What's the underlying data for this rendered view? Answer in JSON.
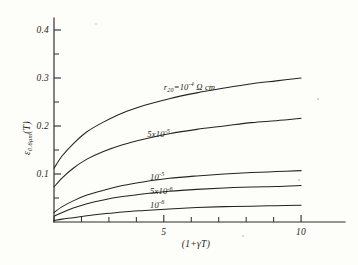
{
  "figure": {
    "background_color": "#fdfdfa",
    "ink_color": "#23231f",
    "y_axis_title_main": "ε",
    "y_axis_title_sub": "0.6μm",
    "y_axis_title_tail": "(T)",
    "x_axis_title": "(1+γT)"
  },
  "chart_data": {
    "type": "line",
    "title": "",
    "subtitle": "",
    "xlabel": "(1+γT)",
    "ylabel": "ε 0.6μm (T)",
    "xlim": [
      1,
      11.6
    ],
    "ylim": [
      0,
      0.425
    ],
    "grid": false,
    "legend_position": "inline-curve-labels",
    "x_ticks_major": [
      5,
      10
    ],
    "x_ticks_major_labels": [
      "5",
      "10"
    ],
    "x_ticks_all": [
      1,
      2,
      3,
      4,
      5,
      6,
      7,
      8,
      9,
      10
    ],
    "y_ticks_major": [
      0.1,
      0.2,
      0.3,
      0.4
    ],
    "y_ticks_major_labels": [
      "0.1",
      "0.2",
      "0.3",
      "0.4"
    ],
    "y_ticks_minor": [
      0.05,
      0.15,
      0.25,
      0.35
    ],
    "x": [
      1,
      1.3,
      1.7,
      2.2,
      2.8,
      3.5,
      4.3,
      5.2,
      6.2,
      7.2,
      8.2,
      9.1,
      10
    ],
    "series": [
      {
        "name": "r20 = 10^-4 ohm cm",
        "label_main": "r",
        "label_sub": "20",
        "label_eq": "=10",
        "label_exp": "-4",
        "label_unit": "Ω cm",
        "label_x": 5.0,
        "label_y": 0.275,
        "values": [
          0.112,
          0.138,
          0.163,
          0.188,
          0.208,
          0.227,
          0.243,
          0.257,
          0.269,
          0.279,
          0.288,
          0.294,
          0.3
        ]
      },
      {
        "name": "5x10^-5",
        "label_main": "5x10",
        "label_sub": "",
        "label_eq": "",
        "label_exp": "-5",
        "label_unit": "",
        "label_x": 4.4,
        "label_y": 0.178,
        "values": [
          0.073,
          0.092,
          0.112,
          0.131,
          0.147,
          0.161,
          0.173,
          0.184,
          0.193,
          0.2,
          0.207,
          0.211,
          0.216
        ]
      },
      {
        "name": "10^-5",
        "label_main": "10",
        "label_sub": "",
        "label_eq": "",
        "label_exp": "-5",
        "label_unit": "",
        "label_x": 4.5,
        "label_y": 0.088,
        "values": [
          0.02,
          0.032,
          0.044,
          0.056,
          0.066,
          0.076,
          0.084,
          0.091,
          0.096,
          0.1,
          0.103,
          0.105,
          0.107
        ]
      },
      {
        "name": "5x10^-6",
        "label_main": "5x10",
        "label_sub": "",
        "label_eq": "",
        "label_exp": "-6",
        "label_unit": "",
        "label_x": 4.5,
        "label_y": 0.058,
        "values": [
          0.012,
          0.02,
          0.029,
          0.038,
          0.046,
          0.053,
          0.059,
          0.064,
          0.068,
          0.071,
          0.073,
          0.074,
          0.076
        ]
      },
      {
        "name": "10^-6",
        "label_main": "10",
        "label_sub": "",
        "label_eq": "",
        "label_exp": "-6",
        "label_unit": "",
        "label_x": 4.5,
        "label_y": 0.029,
        "values": [
          0.003,
          0.006,
          0.009,
          0.013,
          0.017,
          0.021,
          0.024,
          0.027,
          0.03,
          0.032,
          0.033,
          0.034,
          0.035
        ]
      }
    ]
  }
}
